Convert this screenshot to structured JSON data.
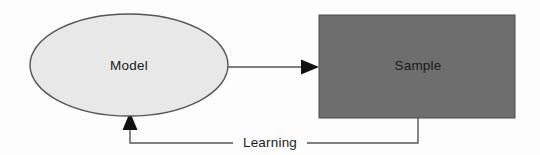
{
  "diagram": {
    "type": "flow-diagram",
    "background_color": "#fdfdfd",
    "nodes": [
      {
        "id": "model",
        "label": "Model",
        "shape": "ellipse",
        "fill_color": "#e8e8e8",
        "stroke_color": "#555555",
        "text_color": "#1a1a1a",
        "cx": 129,
        "cy": 65,
        "rx": 99,
        "ry": 51
      },
      {
        "id": "sample",
        "label": "Sample",
        "shape": "rectangle",
        "fill_color": "#6e6e6e",
        "stroke_color": "#4a4a4a",
        "text_color": "#111111",
        "x": 319,
        "y": 15,
        "width": 196,
        "height": 103
      }
    ],
    "edges": [
      {
        "id": "model-to-sample",
        "from": "model",
        "to": "sample",
        "label": "",
        "stroke_color": "#555555",
        "arrow_color": "#111111",
        "direction": "right"
      },
      {
        "id": "sample-to-model",
        "from": "sample",
        "to": "model",
        "label": "Learning",
        "stroke_color": "#555555",
        "arrow_color": "#111111",
        "direction": "up"
      }
    ]
  }
}
